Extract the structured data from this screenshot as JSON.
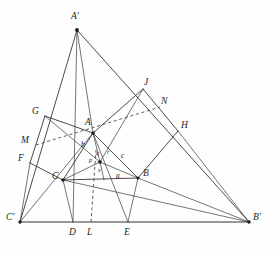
{
  "figure": {
    "ink_color": "#2b2b2b",
    "background_color": "#fefefe",
    "caption": ""
  },
  "points": {
    "A_prime": {
      "label": "A'",
      "x": 77,
      "y": 30
    },
    "B_prime": {
      "label": "B'",
      "x": 249,
      "y": 222
    },
    "C_prime": {
      "label": "C'",
      "x": 20,
      "y": 222
    },
    "A": {
      "label": "A",
      "x": 93,
      "y": 133
    },
    "B": {
      "label": "B",
      "x": 138,
      "y": 178
    },
    "C": {
      "label": "C",
      "x": 63,
      "y": 180
    },
    "G": {
      "label": "G",
      "x": 45,
      "y": 116
    },
    "M": {
      "label": "M",
      "x": 36,
      "y": 145
    },
    "F": {
      "label": "F",
      "x": 30,
      "y": 163
    },
    "J": {
      "label": "J",
      "x": 143,
      "y": 89
    },
    "N": {
      "label": "N",
      "x": 160,
      "y": 107
    },
    "H": {
      "label": "H",
      "x": 178,
      "y": 131
    },
    "D": {
      "label": "D",
      "x": 73,
      "y": 222
    },
    "L": {
      "label": "L",
      "x": 91,
      "y": 222
    },
    "E": {
      "label": "E",
      "x": 128,
      "y": 222
    },
    "P": {
      "label": "",
      "x": 100,
      "y": 162
    }
  },
  "side_labels": {
    "b": {
      "label": "b",
      "x": 82,
      "y": 144
    },
    "c": {
      "label": "c",
      "x": 122,
      "y": 156
    },
    "a": {
      "label": "a",
      "x": 117,
      "y": 175
    },
    "p": {
      "label": "p",
      "x": 91,
      "y": 160
    },
    "q": {
      "label": "q",
      "x": 97,
      "y": 153
    },
    "r": {
      "label": "r",
      "x": 108,
      "y": 152
    },
    "s": {
      "label": "s",
      "x": 99,
      "y": 170
    }
  },
  "vertex_labels": [
    {
      "name": "A-prime",
      "text": "A'",
      "x": 71,
      "y": 12
    },
    {
      "name": "B-prime",
      "text": "B'",
      "x": 253,
      "y": 214
    },
    {
      "name": "C-prime",
      "text": "C'",
      "x": 7,
      "y": 214
    },
    {
      "name": "A",
      "text": "A",
      "x": 85,
      "y": 119
    },
    {
      "name": "B",
      "text": "B",
      "x": 142,
      "y": 170
    },
    {
      "name": "C",
      "text": "C",
      "x": 53,
      "y": 173
    },
    {
      "name": "G",
      "text": "G",
      "x": 33,
      "y": 108
    },
    {
      "name": "M",
      "text": "M",
      "x": 23,
      "y": 137
    },
    {
      "name": "F",
      "text": "F",
      "x": 19,
      "y": 155
    },
    {
      "name": "J",
      "text": "J",
      "x": 144,
      "y": 79
    },
    {
      "name": "N",
      "text": "N",
      "x": 161,
      "y": 98
    },
    {
      "name": "H",
      "text": "H",
      "x": 180,
      "y": 122
    },
    {
      "name": "D",
      "text": "D",
      "x": 70,
      "y": 229
    },
    {
      "name": "L",
      "text": "L",
      "x": 88,
      "y": 229
    },
    {
      "name": "E",
      "text": "E",
      "x": 125,
      "y": 229
    }
  ]
}
